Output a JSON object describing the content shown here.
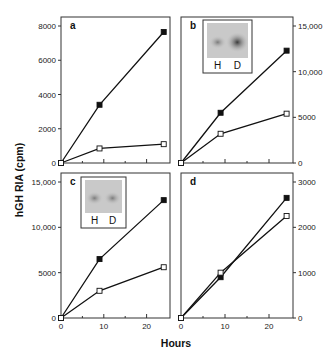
{
  "figure": {
    "ylabel": "hGH RIA (cpm)",
    "xlabel": "Hours"
  },
  "chart_data": [
    {
      "panel": "a",
      "type": "line",
      "x": [
        0,
        9,
        24
      ],
      "series": [
        {
          "name": "filled",
          "marker": "filled-square",
          "values": [
            0,
            3400,
            7650
          ]
        },
        {
          "name": "open",
          "marker": "open-square",
          "values": [
            0,
            850,
            1100
          ]
        }
      ],
      "ylim": [
        0,
        8000
      ],
      "yticks": [
        0,
        2000,
        4000,
        6000,
        8000
      ],
      "ytick_labels": [
        "0",
        "2000",
        "4000",
        "6000",
        "8000"
      ],
      "yaxis_side": "left",
      "xlim": [
        0,
        25
      ],
      "inset": null
    },
    {
      "panel": "b",
      "type": "line",
      "x": [
        0,
        9,
        24
      ],
      "series": [
        {
          "name": "filled",
          "marker": "filled-square",
          "values": [
            0,
            5500,
            12300
          ]
        },
        {
          "name": "open",
          "marker": "open-square",
          "values": [
            0,
            3200,
            5400
          ]
        }
      ],
      "ylim": [
        0,
        15000
      ],
      "yticks": [
        0,
        5000,
        10000,
        15000
      ],
      "ytick_labels": [
        "0",
        "5000",
        "10,000",
        "15,000"
      ],
      "yaxis_side": "right",
      "xlim": [
        0,
        25
      ],
      "inset": {
        "lanes": [
          "H",
          "D"
        ]
      }
    },
    {
      "panel": "c",
      "type": "line",
      "x": [
        0,
        9,
        24
      ],
      "series": [
        {
          "name": "filled",
          "marker": "filled-square",
          "values": [
            0,
            6500,
            13000
          ]
        },
        {
          "name": "open",
          "marker": "open-square",
          "values": [
            0,
            3000,
            5600
          ]
        }
      ],
      "ylim": [
        0,
        15000
      ],
      "yticks": [
        0,
        5000,
        10000,
        15000
      ],
      "ytick_labels": [
        "0",
        "5000",
        "10,000",
        "15,000"
      ],
      "yaxis_side": "left",
      "xlim": [
        0,
        25
      ],
      "xticks": [
        0,
        10,
        20
      ],
      "xtick_labels": [
        "0",
        "10",
        "20"
      ],
      "inset": {
        "lanes": [
          "H",
          "D"
        ]
      }
    },
    {
      "panel": "d",
      "type": "line",
      "x": [
        0,
        9,
        24
      ],
      "series": [
        {
          "name": "filled",
          "marker": "filled-square",
          "values": [
            0,
            900,
            2650
          ]
        },
        {
          "name": "open",
          "marker": "open-square",
          "values": [
            0,
            1000,
            2250
          ]
        }
      ],
      "ylim": [
        0,
        3000
      ],
      "yticks": [
        0,
        1000,
        2000,
        3000
      ],
      "ytick_labels": [
        "0",
        "1000",
        "2000",
        "3000"
      ],
      "yaxis_side": "right",
      "xlim": [
        0,
        25
      ],
      "xticks": [
        0,
        10,
        20
      ],
      "xtick_labels": [
        "0",
        "10",
        "20"
      ],
      "inset": null
    }
  ]
}
